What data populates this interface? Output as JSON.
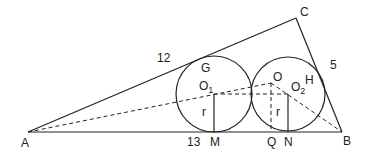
{
  "figure": {
    "type": "geometry",
    "colors": {
      "stroke": "#222222",
      "background": "#ffffff"
    }
  },
  "points": {
    "A": {
      "label": "A",
      "x": 28,
      "y": 132
    },
    "B": {
      "label": "B",
      "x": 342,
      "y": 132
    },
    "C": {
      "label": "C",
      "x": 296,
      "y": 18
    },
    "G": {
      "label": "G"
    },
    "H": {
      "label": "H"
    },
    "O": {
      "label": "O"
    },
    "O1": {
      "label": "O",
      "sub": "1"
    },
    "O2": {
      "label": "O",
      "sub": "2"
    },
    "M": {
      "label": "M"
    },
    "Q": {
      "label": "Q"
    },
    "N": {
      "label": "N"
    }
  },
  "side_lengths": {
    "AC": "12",
    "BC": "5",
    "AB": "13"
  },
  "radius_labels": {
    "left": "r",
    "right": "r"
  },
  "circles": [
    {
      "name": "circle-O1",
      "cx": 214,
      "cy": 94,
      "r": 38
    },
    {
      "name": "circle-O2",
      "cx": 288,
      "cy": 94,
      "r": 37
    }
  ]
}
